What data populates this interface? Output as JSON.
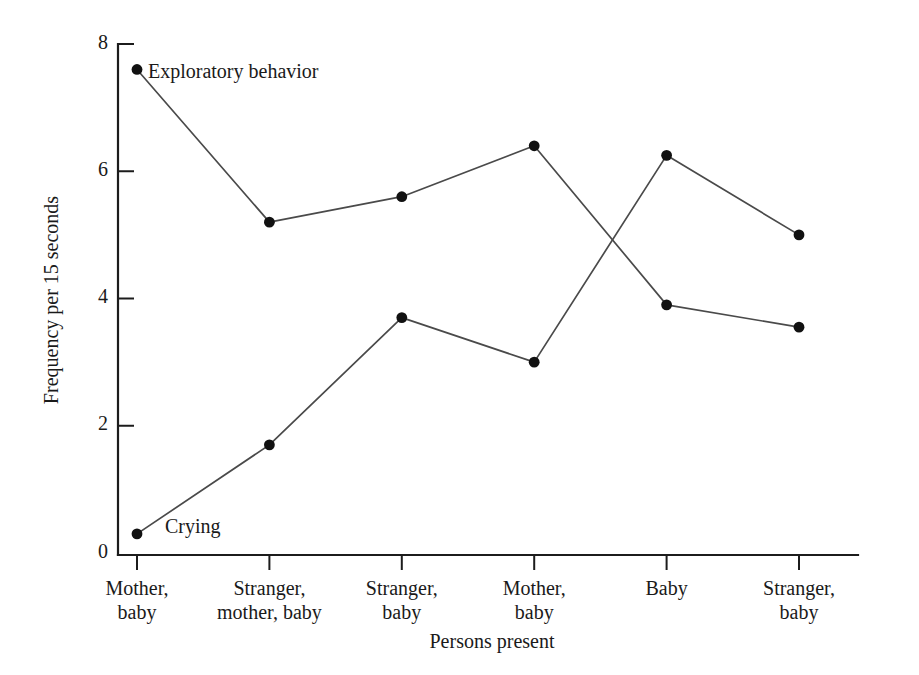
{
  "chart_data": {
    "type": "line",
    "title": "",
    "xlabel": "Persons present",
    "ylabel": "Frequency per 15 seconds",
    "categories": [
      "Mother,\nbaby",
      "Stranger,\nmother, baby",
      "Stranger,\nbaby",
      "Mother,\nbaby",
      "Baby",
      "Stranger,\nbaby"
    ],
    "category_lines": [
      [
        "Mother,",
        "baby"
      ],
      [
        "Stranger,",
        "mother, baby"
      ],
      [
        "Stranger,",
        "baby"
      ],
      [
        "Mother,",
        "baby"
      ],
      [
        "Baby",
        ""
      ],
      [
        "Stranger,",
        "baby"
      ]
    ],
    "ylim": [
      0,
      8
    ],
    "yticks": [
      0,
      2,
      4,
      6,
      8
    ],
    "ytick_labels": [
      "0",
      "2",
      "4",
      "6",
      "8"
    ],
    "grid": false,
    "legend_position": "inline-annotation",
    "series": [
      {
        "name": "Exploratory behavior",
        "label": "Exploratory behavior",
        "color": "#4a4a4a",
        "marker": "filled-circle",
        "values": [
          7.6,
          5.2,
          5.6,
          6.4,
          3.9,
          3.55
        ]
      },
      {
        "name": "Crying",
        "label": "Crying",
        "color": "#4a4a4a",
        "marker": "filled-circle",
        "values": [
          0.3,
          1.7,
          3.7,
          3.0,
          6.25,
          5.0
        ]
      }
    ],
    "annotations": [
      {
        "text": "Exploratory behavior",
        "series": "Exploratory behavior",
        "x_px": 148,
        "y_px": 78
      },
      {
        "text": "Crying",
        "series": "Crying",
        "x_px": 165,
        "y_px": 533
      }
    ]
  }
}
